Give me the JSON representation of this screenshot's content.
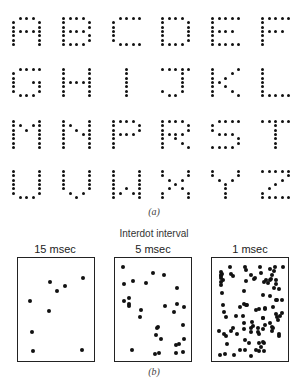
{
  "part_a": {
    "caption": "(a)",
    "letters": [
      "A",
      "B",
      "C",
      "D",
      "E",
      "F",
      "G",
      "H",
      "I",
      "J",
      "K",
      "L",
      "M",
      "N",
      "P",
      "R",
      "S",
      "T",
      "U",
      "V",
      "W",
      "X",
      "Y",
      "Z"
    ]
  },
  "part_b": {
    "heading": "Interdot interval",
    "caption": "(b)",
    "panels": [
      {
        "label": "15 msec",
        "dot_count": 9
      },
      {
        "label": "5 msec",
        "dot_count": 30
      },
      {
        "label": "1 msec",
        "dot_count": 100
      }
    ]
  }
}
